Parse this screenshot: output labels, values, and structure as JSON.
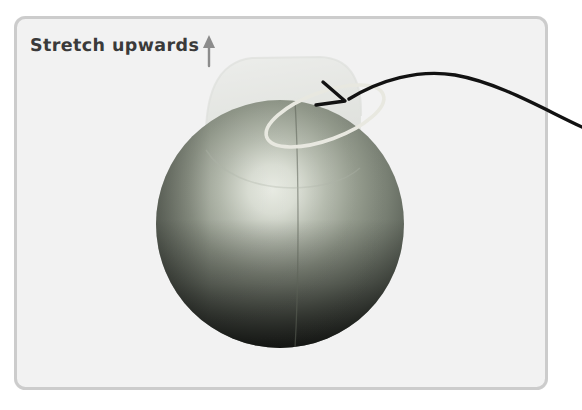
{
  "figure": {
    "kind": "3d-modeling-step-illustration",
    "canvas": {
      "width": 582,
      "height": 410
    },
    "background_color": "#ffffff"
  },
  "panel": {
    "name": "illustration-panel",
    "fill_color": "#f2f2f2",
    "border_color": "#cccccc",
    "x": 14,
    "y": 16,
    "width": 534,
    "height": 374,
    "corner_radius": 10
  },
  "annotation": {
    "label": "Stretch upwards",
    "text_color": "#3a3a3a",
    "direction_icon": "up-arrow-icon",
    "direction_icon_color": "#8c8c8c",
    "icon_x": 205,
    "icon_y": 38
  },
  "callout": {
    "name": "callout-arrow",
    "color": "#121212",
    "description": "curved arrow entering from right edge pointing at the selected rim",
    "tip_x": 345,
    "tip_y": 101,
    "entry_x": 582,
    "entry_y": 123
  },
  "sphere": {
    "name": "sphere-mesh",
    "center_x": 280,
    "center_y": 224,
    "radius": 124,
    "highlight_color": "#e9ece4",
    "midtone_color": "#7f867a",
    "shadow_color": "#16181a",
    "seam_color": "#5c6257",
    "seam_label": "vertical-mesh-seam"
  },
  "selection": {
    "name": "selected-face-ring",
    "shape": "ellipse",
    "stroke_color": "#e8e8e0",
    "center_x": 325,
    "center_y": 116,
    "rx": 62,
    "ry": 24,
    "rotation_deg": -22
  },
  "ghost": {
    "name": "stretch-preview-ghost",
    "description": "translucent preview of the geometry stretched upward",
    "fill_color": "#d5d8d0",
    "opacity": 0.42,
    "top_y": 58,
    "left_x": 205,
    "right_x": 360
  }
}
